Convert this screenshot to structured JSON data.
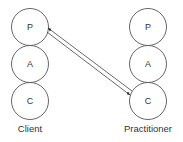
{
  "diagram": {
    "type": "PAC transaction diagram",
    "client": {
      "label": "Client",
      "states": [
        "P",
        "A",
        "C"
      ]
    },
    "practitioner": {
      "label": "Practitioner",
      "states": [
        "P",
        "A",
        "C"
      ]
    },
    "transactions": [
      {
        "from": "practitioner.C",
        "to": "client.P",
        "direction": "arrow toward client P"
      },
      {
        "from": "client.P",
        "to": "practitioner.C",
        "direction": "arrow toward practitioner C"
      }
    ],
    "colors": {
      "stroke": "#555555",
      "text": "#333333",
      "background": "#ffffff"
    }
  }
}
